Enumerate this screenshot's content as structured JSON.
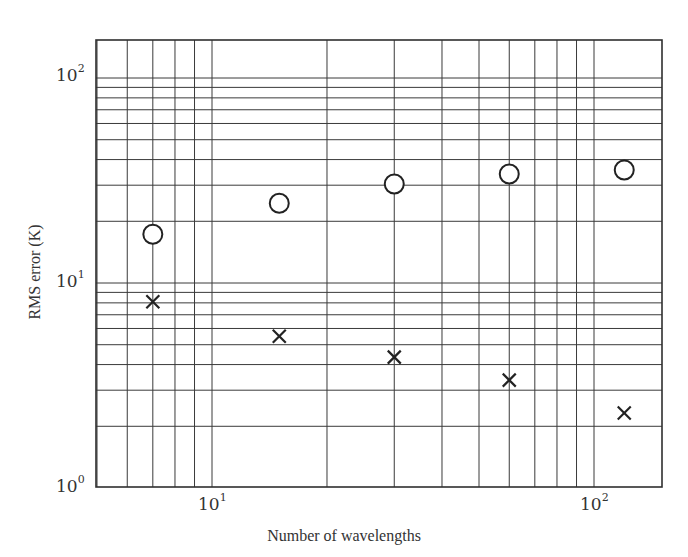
{
  "chart_data": {
    "type": "scatter",
    "title": "",
    "xlabel": "Number of wavelengths",
    "ylabel": "RMS error (K)",
    "xscale": "log",
    "yscale": "log",
    "xlim": [
      5,
      150
    ],
    "ylim": [
      1,
      150
    ],
    "grid": true,
    "legend": null,
    "x_ticks": [
      {
        "base": "10",
        "exp": "1",
        "value": 10
      },
      {
        "base": "10",
        "exp": "2",
        "value": 100
      }
    ],
    "y_ticks": [
      {
        "base": "10",
        "exp": "0",
        "value": 1
      },
      {
        "base": "10",
        "exp": "1",
        "value": 10
      },
      {
        "base": "10",
        "exp": "2",
        "value": 100
      }
    ],
    "x": [
      7,
      15,
      30,
      60,
      120
    ],
    "series": [
      {
        "name": "circles",
        "marker": "circle",
        "values": [
          17.3,
          24.5,
          30.4,
          34.0,
          35.6
        ]
      },
      {
        "name": "crosses",
        "marker": "cross",
        "values": [
          8.1,
          5.5,
          4.35,
          3.36,
          2.32
        ]
      }
    ]
  },
  "labels": {
    "xlabel": "Number of wavelengths",
    "ylabel": "RMS error (K)",
    "x_tick_10_base": "10",
    "x_tick_10_exp": "1",
    "x_tick_100_base": "10",
    "x_tick_100_exp": "2",
    "y_tick_1_base": "10",
    "y_tick_1_exp": "0",
    "y_tick_10_base": "10",
    "y_tick_10_exp": "1",
    "y_tick_100_base": "10",
    "y_tick_100_exp": "2"
  },
  "colors": {
    "grid": "#3a3a3a",
    "marker": "#222222",
    "background": "#ffffff"
  }
}
